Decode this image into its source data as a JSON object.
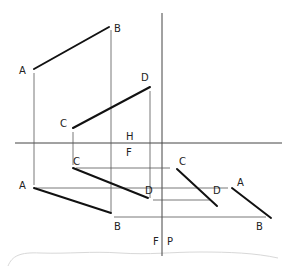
{
  "diagram": {
    "type": "orthographic-projection",
    "views": {
      "top": {
        "lines": [
          {
            "name": "AB",
            "from": {
              "label": "A",
              "x": 34,
              "y": 69
            },
            "to": {
              "label": "B",
              "x": 109,
              "y": 27
            }
          },
          {
            "name": "CD",
            "from": {
              "label": "C",
              "x": 73,
              "y": 128
            },
            "to": {
              "label": "D",
              "x": 150,
              "y": 87
            }
          }
        ]
      },
      "front": {
        "lines": [
          {
            "name": "CD",
            "from": {
              "label": "C",
              "x": 73,
              "y": 168
            },
            "to": {
              "label": "D",
              "x": 148,
              "y": 198
            }
          },
          {
            "name": "AB",
            "from": {
              "label": "A",
              "x": 34,
              "y": 188
            },
            "to": {
              "label": "B",
              "x": 111,
              "y": 213
            }
          }
        ]
      },
      "profile": {
        "lines": [
          {
            "name": "CD",
            "from": {
              "label": "C",
              "x": 177,
              "y": 169
            },
            "to": {
              "label": "D",
              "x": 217,
              "y": 206
            }
          },
          {
            "name": "AB",
            "from": {
              "label": "A",
              "x": 232,
              "y": 188
            },
            "to": {
              "label": "B",
              "x": 271,
              "y": 218
            }
          }
        ]
      }
    },
    "fold_lines": {
      "horizontal": {
        "upper_label": "H",
        "lower_label": "F"
      },
      "vertical": {
        "left_label": "F",
        "right_label": "P"
      }
    },
    "labels": {
      "top_A": "A",
      "top_B": "B",
      "top_C": "C",
      "top_D": "D",
      "front_A": "A",
      "front_B": "B",
      "front_C": "C",
      "front_D": "D",
      "profile_A": "A",
      "profile_B": "B",
      "profile_C": "C",
      "profile_D": "D",
      "fold_H": "H",
      "fold_F_top": "F",
      "fold_F_side": "F",
      "fold_P": "P"
    }
  }
}
